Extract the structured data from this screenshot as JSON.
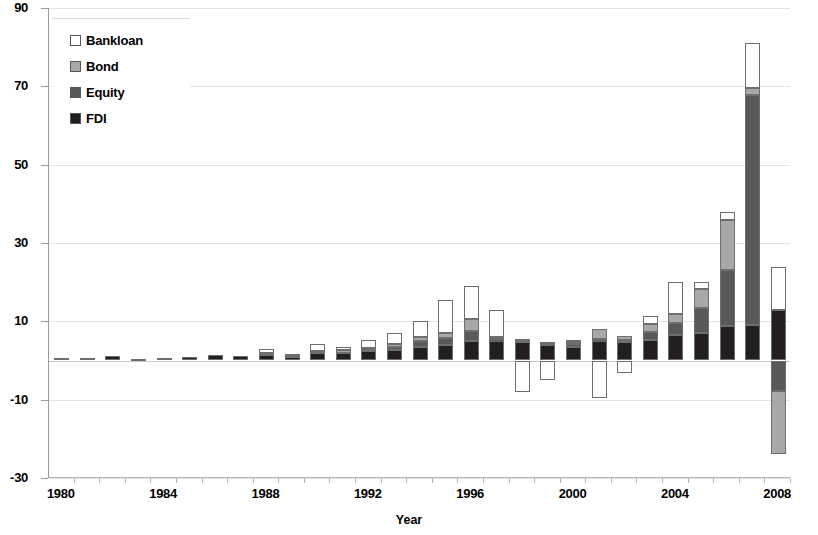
{
  "chart_data": {
    "type": "bar",
    "stacked": true,
    "title": "",
    "subtitle": "",
    "xlabel": "Year",
    "ylabel": "",
    "xlim": [
      1979.5,
      2008.5
    ],
    "ylim": [
      -30,
      90
    ],
    "ytick_values": [
      90,
      70,
      50,
      30,
      10,
      -10,
      -30
    ],
    "ytick_labels": [
      "90",
      "70",
      "50",
      "30",
      "10",
      "-10",
      "-30"
    ],
    "xtick_values": [
      1980,
      1984,
      1988,
      1992,
      1996,
      2000,
      2004,
      2008
    ],
    "xtick_labels": [
      "1980",
      "1984",
      "1988",
      "1992",
      "1996",
      "2000",
      "2004",
      "2008"
    ],
    "grid": "horizontal",
    "legend_position": "top-left",
    "categories": [
      1980,
      1981,
      1982,
      1983,
      1984,
      1985,
      1986,
      1987,
      1988,
      1989,
      1990,
      1991,
      1992,
      1993,
      1994,
      1995,
      1996,
      1997,
      1998,
      1999,
      2000,
      2001,
      2002,
      2003,
      2004,
      2005,
      2006,
      2007,
      2008
    ],
    "series": [
      {
        "name": "FDI",
        "color": "#231f20",
        "values": [
          0.6,
          0.6,
          1.1,
          0.5,
          0.6,
          1.0,
          1.4,
          1.1,
          1.6,
          1.1,
          2.0,
          1.9,
          2.3,
          2.6,
          3.4,
          4.0,
          5.0,
          4.9,
          4.6,
          3.9,
          3.5,
          4.9,
          4.7,
          5.2,
          6.5,
          7.0,
          8.9,
          9.1,
          12.9
        ]
      },
      {
        "name": "Equity",
        "color": "#595959",
        "values": [
          0.0,
          0.0,
          0.0,
          0.0,
          0.0,
          0.0,
          0.0,
          0.0,
          0.2,
          0.2,
          0.3,
          0.4,
          0.6,
          0.9,
          1.6,
          1.8,
          2.5,
          0.5,
          0.4,
          0.4,
          0.6,
          0.5,
          0.6,
          2.2,
          3.2,
          6.3,
          14.2,
          58.7,
          -7.8
        ]
      },
      {
        "name": "Bond",
        "color": "#a8a8a8",
        "values": [
          0.0,
          0.0,
          0.0,
          0.0,
          0.0,
          0.0,
          0.0,
          0.0,
          0.1,
          0.1,
          0.2,
          0.3,
          0.4,
          0.6,
          1.0,
          1.2,
          3.0,
          0.6,
          0.5,
          0.4,
          0.6,
          2.6,
          0.9,
          1.8,
          2.1,
          4.9,
          12.8,
          1.8,
          -16.2
        ]
      },
      {
        "name": "Bankloan",
        "color": "#ffffff",
        "values": [
          0.0,
          0.0,
          0.0,
          0.0,
          0.0,
          0.0,
          0.0,
          0.0,
          1.0,
          0.3,
          1.7,
          0.8,
          1.9,
          3.0,
          4.2,
          8.5,
          8.6,
          7.0,
          -8.0,
          -4.9,
          0.5,
          -9.5,
          -3.2,
          2.2,
          8.2,
          1.8,
          2.1,
          11.4,
          10.9
        ]
      }
    ],
    "legend_entries": [
      {
        "label": "Bankloan",
        "color": "#ffffff"
      },
      {
        "label": "Bond",
        "color": "#a8a8a8"
      },
      {
        "label": "Equity",
        "color": "#595959"
      },
      {
        "label": "FDI",
        "color": "#231f20"
      }
    ],
    "axis_colors": {
      "axis_line": "#9a9a9a",
      "gridline": "#e3e3e3",
      "bar_border": "#6e6e6e"
    }
  }
}
